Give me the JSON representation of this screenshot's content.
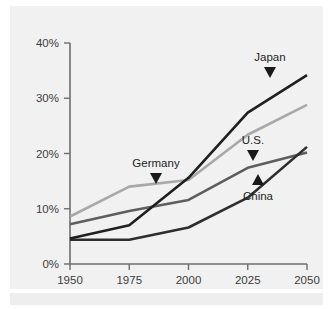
{
  "chart_data": {
    "type": "line",
    "title": "",
    "subtitle": "",
    "xlabel": "",
    "ylabel": "",
    "x": [
      1950,
      1975,
      2000,
      2025,
      2050
    ],
    "xtick_labels": [
      "1950",
      "1975",
      "2000",
      "2025",
      "2050"
    ],
    "ytick_labels": [
      "0%",
      "10%",
      "20%",
      "30%",
      "40%"
    ],
    "ytick_values": [
      0,
      10,
      20,
      30,
      40
    ],
    "xlim": [
      1950,
      2050
    ],
    "ylim": [
      0,
      40
    ],
    "grid": false,
    "legend_position": "inline-annotations",
    "series": [
      {
        "name": "Japan",
        "label": "Japan",
        "color": "#1f1f1f",
        "width": 2.6,
        "marker": "triangle-down",
        "values": [
          4.6,
          7.0,
          15.6,
          27.4,
          34.2
        ]
      },
      {
        "name": "Germany",
        "label": "Germany",
        "color": "#a8a8a8",
        "width": 2.6,
        "marker": "triangle-down",
        "values": [
          8.6,
          14.0,
          15.2,
          23.4,
          28.8
        ]
      },
      {
        "name": "U.S.",
        "label": "U.S.",
        "color": "#5e5e5e",
        "width": 2.6,
        "marker": "triangle-down",
        "values": [
          7.2,
          9.6,
          11.6,
          17.4,
          20.2
        ]
      },
      {
        "name": "China",
        "label": "China",
        "color": "#2e2e2e",
        "width": 2.6,
        "marker": "triangle-up",
        "values": [
          4.4,
          4.4,
          6.6,
          12.0,
          21.2
        ]
      }
    ],
    "annotations": [
      {
        "text": "Japan",
        "series": "Japan",
        "marker": "triangle-down"
      },
      {
        "text": "Germany",
        "series": "Germany",
        "marker": "triangle-down"
      },
      {
        "text": "U.S.",
        "series": "U.S.",
        "marker": "triangle-down"
      },
      {
        "text": "China",
        "series": "China",
        "marker": "triangle-up"
      }
    ],
    "colors": {
      "background": "#f1f1f1",
      "axis": "#6e6e6e",
      "text": "#3c3c3c"
    }
  }
}
